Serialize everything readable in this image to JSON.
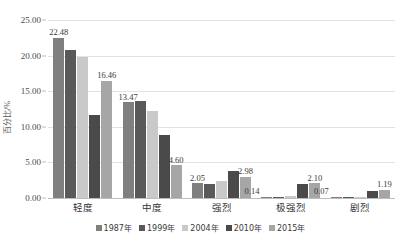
{
  "chart_data": {
    "type": "bar",
    "title": "",
    "xlabel": "",
    "ylabel": "百分比/%",
    "ylim": [
      0,
      25
    ],
    "ytick_step": 5,
    "ytick_labels": [
      "0.00",
      "5.00",
      "10.00",
      "15.00",
      "20.00",
      "25.00"
    ],
    "grid": true,
    "legend_position": "bottom",
    "categories": [
      "轻度",
      "中度",
      "强烈",
      "极强烈",
      "剧烈"
    ],
    "series": [
      {
        "name": "1987年",
        "color": "#7f7f7f",
        "values": [
          22.48,
          13.47,
          2.05,
          0.14,
          0.07
        ]
      },
      {
        "name": "1999年",
        "color": "#595959",
        "values": [
          20.75,
          13.6,
          1.95,
          0.1,
          0.02
        ]
      },
      {
        "name": "2004年",
        "color": "#c9c9c9",
        "values": [
          19.78,
          12.28,
          2.45,
          0.28,
          0.02
        ]
      },
      {
        "name": "2010年",
        "color": "#4a4a4a",
        "values": [
          11.7,
          8.9,
          3.85,
          1.95,
          0.95
        ]
      },
      {
        "name": "2015年",
        "color": "#a6a6a6",
        "values": [
          16.46,
          4.6,
          2.98,
          2.1,
          1.19
        ]
      }
    ],
    "point_labels": [
      {
        "category": "轻度",
        "series": "1987年",
        "text": "22.48",
        "placement": "above"
      },
      {
        "category": "轻度",
        "series": "2015年",
        "text": "16.46",
        "placement": "above"
      },
      {
        "category": "中度",
        "series": "1987年",
        "text": "13.47",
        "placement": "above"
      },
      {
        "category": "中度",
        "series": "2015年",
        "text": "4.60",
        "placement": "above"
      },
      {
        "category": "强烈",
        "series": "1987年",
        "text": "2.05",
        "placement": "above"
      },
      {
        "category": "强烈",
        "series": "2015年",
        "text": "2.98",
        "placement": "above"
      },
      {
        "category": "极强烈",
        "series": "1987年",
        "text": "0.14",
        "placement": "left"
      },
      {
        "category": "极强烈",
        "series": "2015年",
        "text": "2.10",
        "placement": "above"
      },
      {
        "category": "剧烈",
        "series": "1987年",
        "text": "0.07",
        "placement": "left"
      },
      {
        "category": "剧烈",
        "series": "2015年",
        "text": "1.19",
        "placement": "above"
      }
    ]
  }
}
